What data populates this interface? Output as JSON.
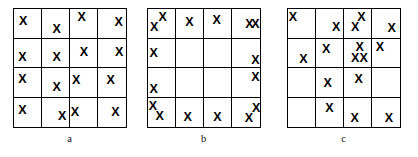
{
  "figure": {
    "width": 418,
    "height": 157,
    "background_color": "#ffffff",
    "grid_line_color": "#000000",
    "mark_color": "#000000",
    "mark_glyph": "X"
  },
  "chart_data": {
    "type": "scatter",
    "title": "",
    "xlabel": "",
    "ylabel": "",
    "grid": true,
    "legend_position": "none",
    "panels": [
      {
        "id": "a",
        "label": "a",
        "pattern": "uniform",
        "rows": 4,
        "cols": 4,
        "total_marks": 16,
        "counts_per_cell": [
          [
            1,
            1,
            1,
            1
          ],
          [
            1,
            1,
            1,
            1
          ],
          [
            1,
            1,
            1,
            1
          ],
          [
            1,
            1,
            1,
            1
          ]
        ],
        "marks": [
          {
            "row": 1,
            "col": 1,
            "x": 0.33,
            "y": 0.42
          },
          {
            "row": 1,
            "col": 2,
            "x": 0.52,
            "y": 0.68
          },
          {
            "row": 1,
            "col": 3,
            "x": 0.42,
            "y": 0.28
          },
          {
            "row": 1,
            "col": 4,
            "x": 0.74,
            "y": 0.45
          },
          {
            "row": 2,
            "col": 1,
            "x": 0.3,
            "y": 0.62
          },
          {
            "row": 2,
            "col": 2,
            "x": 0.52,
            "y": 0.62
          },
          {
            "row": 2,
            "col": 3,
            "x": 0.5,
            "y": 0.45
          },
          {
            "row": 2,
            "col": 4,
            "x": 0.76,
            "y": 0.45
          },
          {
            "row": 3,
            "col": 1,
            "x": 0.3,
            "y": 0.38
          },
          {
            "row": 3,
            "col": 2,
            "x": 0.52,
            "y": 0.66
          },
          {
            "row": 3,
            "col": 3,
            "x": 0.22,
            "y": 0.42
          },
          {
            "row": 3,
            "col": 4,
            "x": 0.45,
            "y": 0.42
          },
          {
            "row": 4,
            "col": 1,
            "x": 0.3,
            "y": 0.42
          },
          {
            "row": 4,
            "col": 2,
            "x": 0.72,
            "y": 0.62
          },
          {
            "row": 4,
            "col": 3,
            "x": 0.18,
            "y": 0.48
          },
          {
            "row": 4,
            "col": 4,
            "x": 0.62,
            "y": 0.48
          }
        ]
      },
      {
        "id": "b",
        "label": "b",
        "pattern": "edge-clustered",
        "rows": 4,
        "cols": 4,
        "total_marks": 16,
        "counts_per_cell": [
          [
            2,
            1,
            1,
            2
          ],
          [
            1,
            0,
            0,
            1
          ],
          [
            1,
            0,
            0,
            1
          ],
          [
            2,
            1,
            1,
            2
          ]
        ],
        "marks": [
          {
            "row": 1,
            "col": 1,
            "x": 0.22,
            "y": 0.62
          },
          {
            "row": 1,
            "col": 1,
            "x": 0.52,
            "y": 0.26
          },
          {
            "row": 1,
            "col": 2,
            "x": 0.48,
            "y": 0.45
          },
          {
            "row": 1,
            "col": 3,
            "x": 0.45,
            "y": 0.38
          },
          {
            "row": 1,
            "col": 4,
            "x": 0.62,
            "y": 0.5
          },
          {
            "row": 1,
            "col": 4,
            "x": 0.84,
            "y": 0.5
          },
          {
            "row": 2,
            "col": 1,
            "x": 0.2,
            "y": 0.48
          },
          {
            "row": 2,
            "col": 4,
            "x": 0.84,
            "y": 0.72
          },
          {
            "row": 3,
            "col": 1,
            "x": 0.2,
            "y": 0.72
          },
          {
            "row": 3,
            "col": 4,
            "x": 0.84,
            "y": 0.3
          },
          {
            "row": 4,
            "col": 1,
            "x": 0.18,
            "y": 0.3
          },
          {
            "row": 4,
            "col": 1,
            "x": 0.42,
            "y": 0.62
          },
          {
            "row": 4,
            "col": 2,
            "x": 0.42,
            "y": 0.66
          },
          {
            "row": 4,
            "col": 3,
            "x": 0.48,
            "y": 0.66
          },
          {
            "row": 4,
            "col": 4,
            "x": 0.6,
            "y": 0.7
          },
          {
            "row": 4,
            "col": 4,
            "x": 0.86,
            "y": 0.34
          }
        ]
      },
      {
        "id": "c",
        "label": "c",
        "pattern": "center-clustered",
        "rows": 4,
        "cols": 4,
        "total_marks": 16,
        "counts_per_cell": [
          [
            1,
            1,
            2,
            1
          ],
          [
            1,
            1,
            3,
            1
          ],
          [
            0,
            1,
            1,
            0
          ],
          [
            0,
            1,
            1,
            1
          ]
        ],
        "marks": [
          {
            "row": 1,
            "col": 1,
            "x": 0.18,
            "y": 0.26
          },
          {
            "row": 1,
            "col": 2,
            "x": 0.72,
            "y": 0.62
          },
          {
            "row": 1,
            "col": 3,
            "x": 0.62,
            "y": 0.26
          },
          {
            "row": 1,
            "col": 3,
            "x": 0.4,
            "y": 0.62
          },
          {
            "row": 1,
            "col": 4,
            "x": 0.7,
            "y": 0.64
          },
          {
            "row": 2,
            "col": 1,
            "x": 0.55,
            "y": 0.7
          },
          {
            "row": 2,
            "col": 2,
            "x": 0.36,
            "y": 0.36
          },
          {
            "row": 2,
            "col": 3,
            "x": 0.56,
            "y": 0.3
          },
          {
            "row": 2,
            "col": 3,
            "x": 0.4,
            "y": 0.66
          },
          {
            "row": 2,
            "col": 3,
            "x": 0.7,
            "y": 0.66
          },
          {
            "row": 2,
            "col": 4,
            "x": 0.28,
            "y": 0.3
          },
          {
            "row": 3,
            "col": 2,
            "x": 0.42,
            "y": 0.52
          },
          {
            "row": 3,
            "col": 3,
            "x": 0.52,
            "y": 0.38
          },
          {
            "row": 4,
            "col": 2,
            "x": 0.48,
            "y": 0.34
          },
          {
            "row": 4,
            "col": 3,
            "x": 0.38,
            "y": 0.7
          },
          {
            "row": 4,
            "col": 4,
            "x": 0.6,
            "y": 0.7
          }
        ]
      }
    ]
  }
}
